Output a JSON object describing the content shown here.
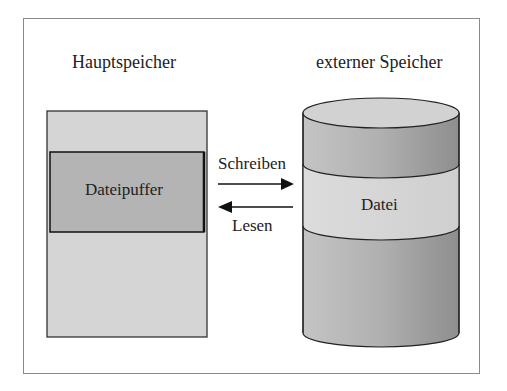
{
  "diagram": {
    "left_title": "Hauptspeicher",
    "right_title": "externer Speicher",
    "buffer_label": "Dateipuffer",
    "file_label": "Datei",
    "write_label": "Schreiben",
    "read_label": "Lesen",
    "colors": {
      "memory_fill": "#d4d4d4",
      "buffer_fill": "#b3b3b3",
      "cylinder_light": "#d6d6d6",
      "cylinder_dark": "#a8a8a8",
      "stroke": "#222222"
    }
  }
}
